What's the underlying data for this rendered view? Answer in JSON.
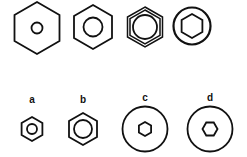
{
  "figure": {
    "top_row": [
      {
        "id": "top-1",
        "outer": "hexagon",
        "inner": "circle",
        "description": "large hexagon with small hole"
      },
      {
        "id": "top-2",
        "outer": "hexagon",
        "inner": "circle",
        "description": "hexagon with medium circle"
      },
      {
        "id": "top-3",
        "outer": "double-hexagon",
        "inner": "circle",
        "description": "double-line hexagon with large circle"
      },
      {
        "id": "top-4",
        "outer": "circle",
        "inner": "hexagon",
        "description": "circle with hexagon socket"
      }
    ],
    "bottom_row": [
      {
        "label": "a",
        "outer": "hexagon",
        "inner": "circle"
      },
      {
        "label": "b",
        "outer": "hexagon",
        "inner": "circle"
      },
      {
        "label": "c",
        "outer": "circle",
        "inner": "hexagon"
      },
      {
        "label": "d",
        "outer": "circle",
        "inner": "hexagon"
      }
    ]
  },
  "colors": {
    "stroke": "#111111",
    "background": "#ffffff"
  }
}
